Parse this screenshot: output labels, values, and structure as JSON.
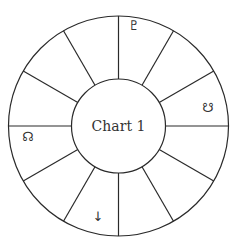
{
  "chart": {
    "title": "Chart 1",
    "houses": 12,
    "center": [
      118.5,
      126
    ],
    "outer_radius": 110,
    "inner_radius": 47,
    "line_color": "#2a2a2a",
    "text_color": "#333333"
  },
  "glyphs": [
    {
      "name": "pluto-glyph-icon",
      "symbol": "♇",
      "x": 134,
      "y": 30,
      "description": "Pluto symbol in top house right of vertical spoke"
    },
    {
      "name": "descending-node-glyph-icon",
      "symbol": "☋",
      "x": 208,
      "y": 112,
      "description": "South node symbol in right house above horizontal spoke"
    },
    {
      "name": "ascending-node-glyph-icon",
      "symbol": "☊",
      "x": 28,
      "y": 141,
      "description": "North node symbol in left house below horizontal spoke"
    },
    {
      "name": "down-arrow-glyph-icon",
      "symbol": "↓",
      "x": 98,
      "y": 221,
      "description": "Down arrow in bottom house left of vertical spoke"
    }
  ]
}
